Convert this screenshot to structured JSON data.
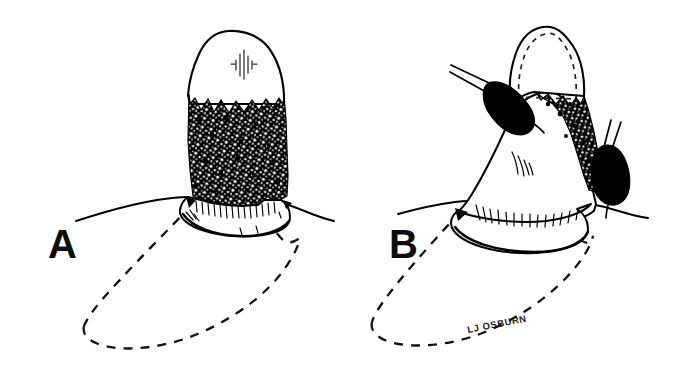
{
  "figure": {
    "background_color": "#ffffff",
    "ink_color": "#000000",
    "type": "pen-and-ink line drawing",
    "panels": [
      {
        "id": "A",
        "label": "A",
        "label_x": 48,
        "label_y": 258,
        "description": "tooth crown emerging from gingiva with heavy stippled calculus deposit covering the cervical third, dashed outline of the submerged root below the gum line",
        "features": {
          "crown": "white enamel crown with small vertical hatch cluster",
          "calculus": "dense black stippled band around cervical area",
          "gingival_collar": "scalloped gum collar with short hatch strokes",
          "root": "dashed elliptical root outline below gumline",
          "instruments": "none"
        }
      },
      {
        "id": "B",
        "label": "B",
        "label_x": 389,
        "label_y": 258,
        "description": "same tooth after scaling, crown shown with dashed hidden outline, two black curette instrument tips engaging the root surface, residual calculus strip remaining",
        "features": {
          "crown": "crown outline with dashed inner hidden contour",
          "calculus": "narrow residual black stippled strip on distal surface",
          "gingival_collar": "scalloped gum collar with many short hatch strokes",
          "root": "dashed elliptical root outline below gumline",
          "instruments": "two black teardrop curette tips with twin-line shanks"
        }
      }
    ],
    "signature": {
      "text": "LJ OSBURN",
      "x": 468,
      "y": 333,
      "rotation": -11
    }
  }
}
